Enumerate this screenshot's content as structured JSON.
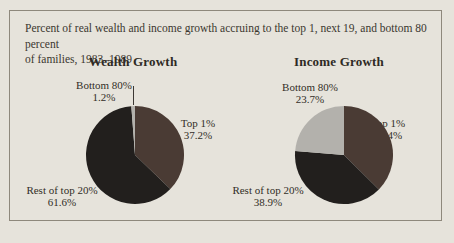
{
  "window": {
    "background_color": "#e6e3db",
    "frame_border_color": "#8e887c",
    "text_color": "#322e27"
  },
  "caption": {
    "line1": "Percent of real wealth and income growth accruing to the top 1, next 19, and bottom 80 percent",
    "line2": "of families, 1983–1989"
  },
  "chart_data": [
    {
      "type": "pie",
      "title": "Wealth Growth",
      "start_angle_deg": 0,
      "direction": "clockwise",
      "slices": [
        {
          "label": "Top 1%",
          "value": 37.2,
          "value_label": "37.2%",
          "color": "#4a3b34"
        },
        {
          "label": "Rest of top 20%",
          "value": 61.6,
          "value_label": "61.6%",
          "color": "#221f1d"
        },
        {
          "label": "Bottom 80%",
          "value": 1.2,
          "value_label": "1.2%",
          "color": "#b3b1ac"
        }
      ]
    },
    {
      "type": "pie",
      "title": "Income Growth",
      "start_angle_deg": 0,
      "direction": "clockwise",
      "slices": [
        {
          "label": "Top 1%",
          "value": 37.4,
          "value_label": "37.4%",
          "color": "#4a3b34"
        },
        {
          "label": "Rest of top 20%",
          "value": 38.9,
          "value_label": "38.9%",
          "color": "#221f1d"
        },
        {
          "label": "Bottom 80%",
          "value": 23.7,
          "value_label": "23.7%",
          "color": "#b3b1ac"
        }
      ]
    }
  ]
}
